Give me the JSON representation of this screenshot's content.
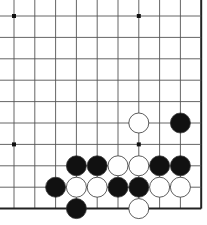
{
  "board": {
    "description": "Go problem diagram, lower-right corner view",
    "cols": 10,
    "rows": 10,
    "edges": {
      "right": true,
      "bottom": true,
      "left": false,
      "top": false
    },
    "colors": {
      "line": "#555555",
      "edge": "#222222",
      "black": "#111111",
      "white": "#ffffff",
      "stone_outline": "#333333",
      "background": "#ffffff"
    },
    "star_points": [
      [
        0,
        0
      ],
      [
        6,
        0
      ],
      [
        0,
        6
      ],
      [
        6,
        6
      ]
    ],
    "stones": [
      {
        "col": 6,
        "row": 5,
        "color": "white"
      },
      {
        "col": 8,
        "row": 5,
        "color": "black"
      },
      {
        "col": 3,
        "row": 7,
        "color": "black"
      },
      {
        "col": 4,
        "row": 7,
        "color": "black"
      },
      {
        "col": 5,
        "row": 7,
        "color": "white"
      },
      {
        "col": 6,
        "row": 7,
        "color": "white"
      },
      {
        "col": 7,
        "row": 7,
        "color": "black"
      },
      {
        "col": 8,
        "row": 7,
        "color": "black"
      },
      {
        "col": 2,
        "row": 8,
        "color": "black"
      },
      {
        "col": 3,
        "row": 8,
        "color": "white"
      },
      {
        "col": 4,
        "row": 8,
        "color": "white"
      },
      {
        "col": 5,
        "row": 8,
        "color": "black"
      },
      {
        "col": 6,
        "row": 8,
        "color": "black"
      },
      {
        "col": 7,
        "row": 8,
        "color": "white"
      },
      {
        "col": 8,
        "row": 8,
        "color": "white"
      },
      {
        "col": 3,
        "row": 9,
        "color": "black"
      },
      {
        "col": 6,
        "row": 9,
        "color": "white"
      }
    ]
  }
}
